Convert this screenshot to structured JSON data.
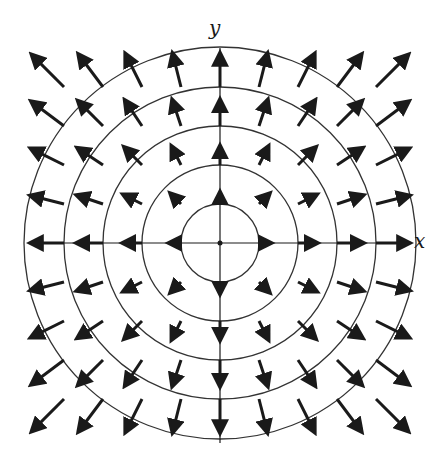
{
  "figure": {
    "x_label": "x",
    "y_label": "y",
    "center": [
      220,
      243
    ],
    "grid_spacing_px": 39,
    "grid_range": [
      -4,
      4
    ],
    "circle_radii_px": [
      39,
      78,
      117,
      156,
      196
    ],
    "colors": {
      "ink": "#1a1a1a",
      "circle": "#333333",
      "background": "#ffffff"
    },
    "arrow": {
      "base_length_px": 4,
      "length_per_unit_px": 7.2,
      "stroke_width": 3
    }
  }
}
